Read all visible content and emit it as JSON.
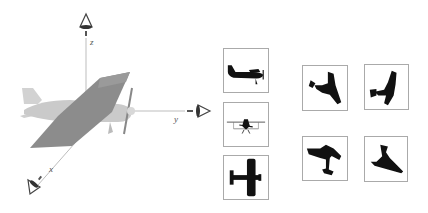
{
  "figure": {
    "axes": {
      "x": {
        "label": "x"
      },
      "y": {
        "label": "y"
      },
      "z": {
        "label": "z"
      }
    },
    "object": "airplane-3d-model",
    "cameras": [
      "camera-z",
      "camera-y",
      "camera-x"
    ],
    "canonical_views": [
      {
        "name": "side-view"
      },
      {
        "name": "front-view"
      },
      {
        "name": "top-view"
      }
    ],
    "random_views": [
      {
        "name": "random-view-1"
      },
      {
        "name": "random-view-2"
      },
      {
        "name": "random-view-3"
      },
      {
        "name": "random-view-4"
      }
    ]
  },
  "colors": {
    "axis": "#b0b0b0",
    "plane_body": "#c8c8c8",
    "plane_wing": "#8a8a8a",
    "silhouette": "#111111",
    "thumb_border": "#aaaaaa"
  }
}
